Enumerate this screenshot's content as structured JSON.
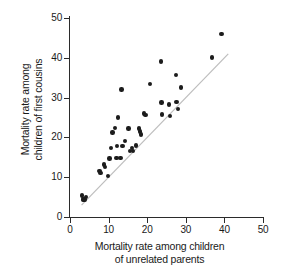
{
  "chart_data": {
    "type": "scatter",
    "title": "",
    "xlabel": "Mortality rate among children of unrelated parents",
    "ylabel": "Mortality rate among children of first cousins",
    "xlabel_lines": [
      "Mortality rate among children",
      "of unrelated parents"
    ],
    "ylabel_lines": [
      "Mortality rate among",
      "children of first cousins"
    ],
    "xlim": [
      0,
      50
    ],
    "ylim": [
      0,
      50
    ],
    "xticks": [
      0,
      10,
      20,
      30,
      40,
      50
    ],
    "yticks": [
      0,
      10,
      20,
      30,
      40,
      50
    ],
    "xtick_labels": [
      "0",
      "10",
      "20",
      "30",
      "40",
      "50"
    ],
    "ytick_labels": [
      "0",
      "10",
      "20",
      "30",
      "40",
      "50"
    ],
    "grid": false,
    "legend": "none",
    "marker": "filled-circle",
    "marker_color": "#1c1c1c",
    "reference_line": {
      "label": "y = x identity line",
      "color": "#bdbdbd",
      "x_start": 3.0,
      "y_start": 3.0,
      "x_end": 41.0,
      "y_end": 41.0
    },
    "points": [
      {
        "x": 3.1,
        "y": 5.4
      },
      {
        "x": 3.3,
        "y": 4.6
      },
      {
        "x": 3.5,
        "y": 4.2
      },
      {
        "x": 3.8,
        "y": 4.4
      },
      {
        "x": 4.1,
        "y": 5.0
      },
      {
        "x": 7.6,
        "y": 11.6
      },
      {
        "x": 7.9,
        "y": 11.0
      },
      {
        "x": 8.8,
        "y": 13.2
      },
      {
        "x": 9.0,
        "y": 12.6
      },
      {
        "x": 9.8,
        "y": 10.3
      },
      {
        "x": 10.2,
        "y": 14.7
      },
      {
        "x": 10.6,
        "y": 17.4
      },
      {
        "x": 11.0,
        "y": 21.2
      },
      {
        "x": 11.6,
        "y": 22.4
      },
      {
        "x": 12.0,
        "y": 14.9
      },
      {
        "x": 12.2,
        "y": 17.9
      },
      {
        "x": 12.4,
        "y": 25.0
      },
      {
        "x": 13.1,
        "y": 14.9
      },
      {
        "x": 13.3,
        "y": 32.0
      },
      {
        "x": 13.6,
        "y": 17.8
      },
      {
        "x": 14.2,
        "y": 19.1
      },
      {
        "x": 15.2,
        "y": 22.2
      },
      {
        "x": 15.6,
        "y": 16.6
      },
      {
        "x": 16.0,
        "y": 17.3
      },
      {
        "x": 16.3,
        "y": 16.6
      },
      {
        "x": 17.1,
        "y": 18.0
      },
      {
        "x": 17.9,
        "y": 22.2
      },
      {
        "x": 18.1,
        "y": 21.5
      },
      {
        "x": 18.4,
        "y": 20.7
      },
      {
        "x": 19.1,
        "y": 26.0
      },
      {
        "x": 19.6,
        "y": 25.7
      },
      {
        "x": 20.7,
        "y": 33.4
      },
      {
        "x": 23.5,
        "y": 39.1
      },
      {
        "x": 23.7,
        "y": 28.8
      },
      {
        "x": 23.9,
        "y": 25.8
      },
      {
        "x": 25.6,
        "y": 28.3
      },
      {
        "x": 25.9,
        "y": 25.4
      },
      {
        "x": 27.4,
        "y": 35.7
      },
      {
        "x": 27.6,
        "y": 28.9
      },
      {
        "x": 27.9,
        "y": 27.2
      },
      {
        "x": 28.7,
        "y": 32.5
      },
      {
        "x": 36.8,
        "y": 40.1
      },
      {
        "x": 39.2,
        "y": 46.0
      }
    ]
  }
}
